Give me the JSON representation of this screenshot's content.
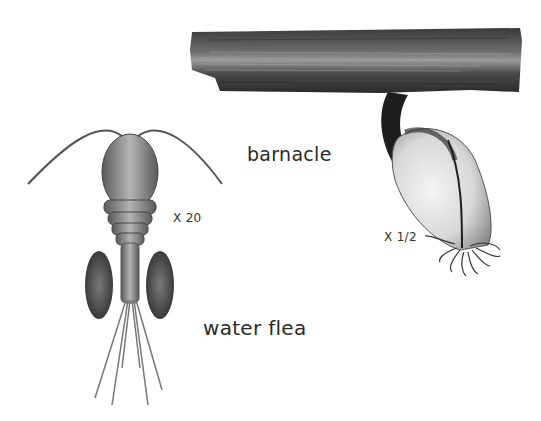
{
  "labels": {
    "barnacle": "barnacle",
    "water_flea": "water flea",
    "water_flea_scale": "X 20",
    "barnacle_scale": "X 1/2"
  },
  "colors": {
    "background": "#ffffff",
    "wood_dark": "#2b2b2b",
    "wood_light": "#8a8a8a",
    "stalk": "#1e1e1e",
    "shell": "#e8e8e8",
    "flea_body": "#9a9a9a",
    "egg_sacs": "#4a4a4a"
  },
  "illustrations": [
    {
      "name": "barnacle",
      "description": "goose barnacle hanging from a piece of driftwood"
    },
    {
      "name": "water flea",
      "description": "copepod with long antennae and two egg sacs"
    }
  ]
}
